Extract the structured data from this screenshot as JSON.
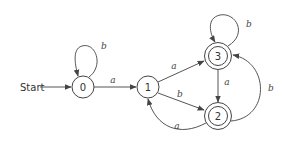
{
  "diagram": {
    "type": "finite-automaton",
    "start_label": "Start",
    "states": [
      {
        "id": "0",
        "label": "0",
        "accepting": false,
        "start": true
      },
      {
        "id": "1",
        "label": "1",
        "accepting": false,
        "start": false
      },
      {
        "id": "2",
        "label": "2",
        "accepting": true,
        "start": false
      },
      {
        "id": "3",
        "label": "3",
        "accepting": true,
        "start": false
      }
    ],
    "transitions": [
      {
        "from": "0",
        "to": "0",
        "symbol": "b"
      },
      {
        "from": "0",
        "to": "1",
        "symbol": "a"
      },
      {
        "from": "1",
        "to": "3",
        "symbol": "a"
      },
      {
        "from": "1",
        "to": "2",
        "symbol": "b"
      },
      {
        "from": "3",
        "to": "3",
        "symbol": "b"
      },
      {
        "from": "3",
        "to": "2",
        "symbol": "a"
      },
      {
        "from": "2",
        "to": "3",
        "symbol": "b"
      },
      {
        "from": "2",
        "to": "1",
        "symbol": "a"
      }
    ],
    "colors": {
      "stroke": "#444444",
      "background": "#ffffff"
    }
  }
}
